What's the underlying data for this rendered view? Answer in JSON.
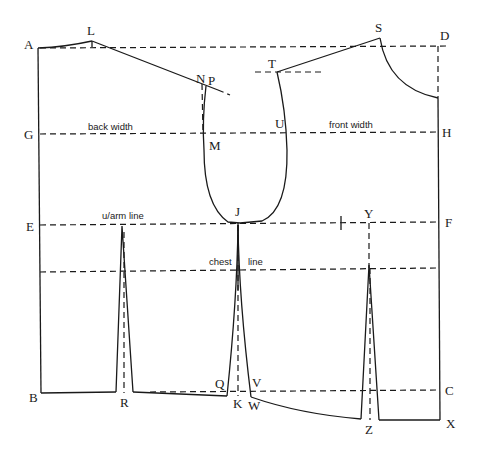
{
  "diagram": {
    "type": "bodice-block-pattern",
    "line_labels": {
      "back_width": "back width",
      "front_width": "front width",
      "underarm": "u/arm line",
      "chest_left": "chest",
      "chest_right": "line"
    },
    "points": {
      "A": "A",
      "B": "B",
      "C": "C",
      "D": "D",
      "E": "E",
      "F": "F",
      "G": "G",
      "H": "H",
      "J": "J",
      "K": "K",
      "L": "L",
      "M": "M",
      "N": "N",
      "P": "P",
      "Q": "Q",
      "R": "R",
      "S": "S",
      "T": "T",
      "U": "U",
      "V": "V",
      "W": "W",
      "X": "X",
      "Y": "Y",
      "Z": "Z"
    },
    "colors": {
      "ink": "#1a1a1a",
      "paper": "#ffffff"
    }
  }
}
